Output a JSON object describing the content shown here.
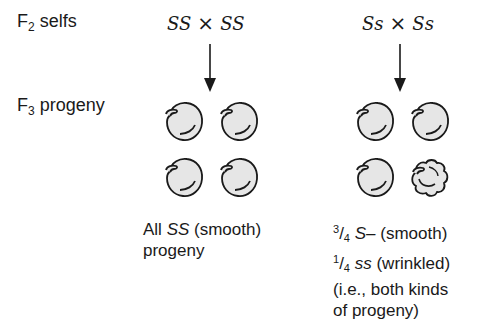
{
  "rows": {
    "f2_label": {
      "prefix": "F",
      "subscript": "2",
      "text": "selfs"
    },
    "f3_label": {
      "prefix": "F",
      "subscript": "3",
      "text": "progeny"
    }
  },
  "crosses": [
    {
      "left": "SS",
      "operator": "×",
      "right": "SS"
    },
    {
      "left": "Ss",
      "operator": "×",
      "right": "Ss"
    }
  ],
  "progeny_groups": [
    {
      "peas": [
        "smooth",
        "smooth",
        "smooth",
        "smooth"
      ]
    },
    {
      "peas": [
        "smooth",
        "smooth",
        "smooth",
        "wrinkled"
      ]
    }
  ],
  "captions": {
    "left": {
      "line1_prefix": "All ",
      "line1_genotype": "SS",
      "line1_suffix": " (smooth)",
      "line2": "progeny"
    },
    "right": {
      "line1_num": "3",
      "line1_slash": "/",
      "line1_den": "4",
      "line1_genotype": "S–",
      "line1_suffix": " (smooth)",
      "line2_num": "1",
      "line2_slash": "/",
      "line2_den": "4",
      "line2_genotype": "ss",
      "line2_suffix": " (wrinkled)",
      "line3": "(i.e., both kinds",
      "line4": "of progeny)"
    }
  },
  "colors": {
    "ink": "#1a1a1a",
    "pea_fill": "#e6e6e6",
    "background": "#ffffff"
  }
}
